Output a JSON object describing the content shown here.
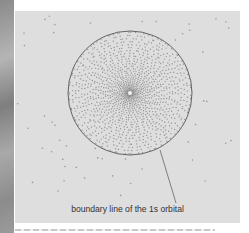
{
  "figure": {
    "label": "boundary line of the 1s orbital",
    "colors": {
      "panel_background": "#dedede",
      "dot_color": "#8a8a8a",
      "boundary_color": "#555555",
      "label_color": "#333333"
    },
    "orbital": {
      "name": "1s orbital",
      "center_x": 115,
      "center_y": 82,
      "boundary_radius": 62,
      "leader_line": {
        "x1": 145,
        "y1": 139,
        "x2": 161,
        "y2": 192
      }
    }
  }
}
